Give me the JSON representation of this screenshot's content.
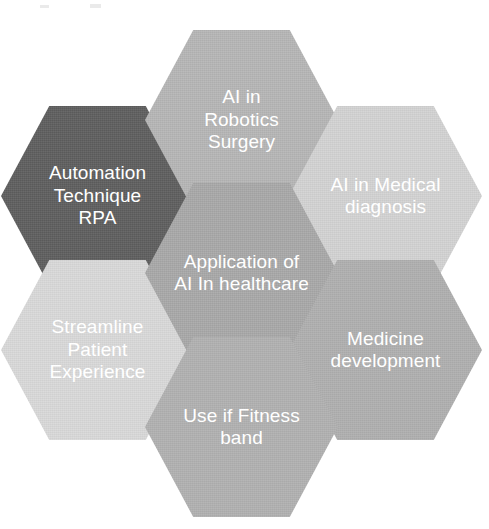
{
  "diagram": {
    "title": "Application of AI In healthcare",
    "type": "hexagon-hub-and-spoke",
    "background_color": "#ffffff",
    "text_color": "#ffffff",
    "center": {
      "id": "center",
      "label": "Application of\nAI In healthcare",
      "color": "#a8a8a8"
    },
    "nodes": [
      {
        "id": "ai-robotics-surgery",
        "position": "top",
        "label": "AI in\nRobotics\nSurgery",
        "color": "#b6b6b6"
      },
      {
        "id": "ai-medical-diagnosis",
        "position": "upper-right",
        "label": "AI in Medical\ndiagnosis",
        "color": "#d3d3d3"
      },
      {
        "id": "medicine-development",
        "position": "lower-right",
        "label": "Medicine\ndevelopment",
        "color": "#afafaf"
      },
      {
        "id": "use-if-fitness-band",
        "position": "bottom",
        "label": "Use if Fitness\nband",
        "color": "#b1b1b1"
      },
      {
        "id": "streamline-patient-experience",
        "position": "lower-left",
        "label": "Streamline\nPatient\nExperience",
        "color": "#d9d9d9"
      },
      {
        "id": "automation-technique-rpa",
        "position": "upper-left",
        "label": "Automation\nTechnique\nRPA",
        "color": "#5e5e5e"
      }
    ]
  }
}
